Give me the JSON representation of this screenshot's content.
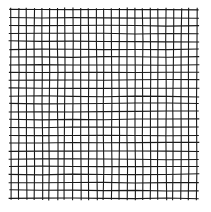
{
  "image": {
    "description": "hand-drawn square grid of black lines on white background",
    "width": 211,
    "height": 212,
    "background": "#ffffff",
    "stroke_color": "#1a1a1a"
  },
  "grid": {
    "x_start": 11,
    "x_end": 197,
    "y_start": 10,
    "y_end": 198,
    "vertical_lines": 25,
    "horizontal_lines": 25,
    "stroke_width": 1.1,
    "overhang": 2,
    "jitter": 0.8
  }
}
